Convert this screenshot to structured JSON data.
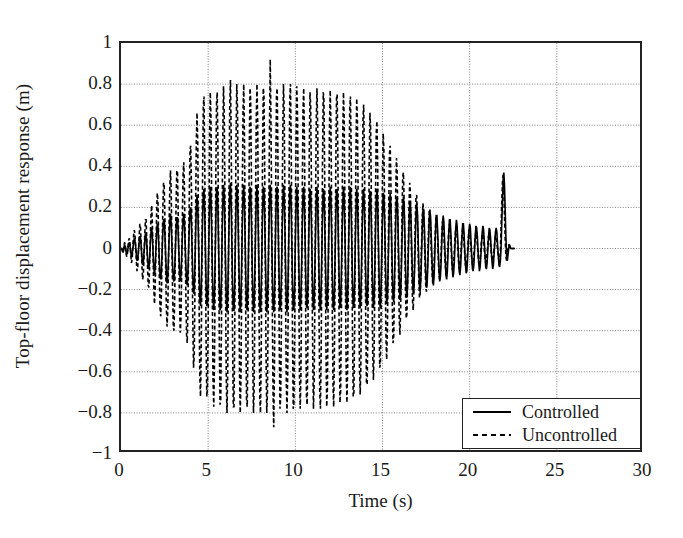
{
  "chart_data": {
    "type": "line",
    "title": "",
    "xlabel": "Time (s)",
    "ylabel": "Top-floor displacement response (m)",
    "xlim": [
      0,
      30
    ],
    "ylim": [
      -1,
      1
    ],
    "xticks": [
      0,
      5,
      10,
      15,
      20,
      25,
      30
    ],
    "yticks": [
      -1,
      -0.8,
      -0.6,
      -0.4,
      -0.2,
      0,
      0.2,
      0.4,
      0.6,
      0.8,
      1
    ],
    "xticklabels": [
      "0",
      "5",
      "10",
      "15",
      "20",
      "25",
      "30"
    ],
    "yticklabels": [
      "−1",
      "−0.8",
      "−0.6",
      "−0.4",
      "−0.2",
      "0",
      "0.2",
      "0.4",
      "0.6",
      "0.8",
      "1"
    ],
    "grid": true,
    "grid_style": "dotted",
    "grid_color": "#808080",
    "legend_position": "lower right",
    "legend_entries": [
      "Controlled",
      "Uncontrolled"
    ],
    "series": [
      {
        "name": "Controlled",
        "style": "solid",
        "color": "#000000",
        "linewidth": 1.6,
        "dt": 0.04,
        "x_start": 0,
        "values": [
          0.0,
          0.0,
          -0.01,
          -0.02,
          0.0,
          0.02,
          0.01,
          -0.01,
          -0.03,
          -0.02,
          0.0,
          0.02,
          0.03,
          0.01,
          -0.02,
          -0.04,
          -0.03,
          0.0,
          0.03,
          0.05,
          0.04,
          0.01,
          -0.03,
          -0.06,
          -0.05,
          -0.01,
          0.03,
          0.06,
          0.05,
          0.01,
          -0.04,
          -0.08,
          -0.07,
          -0.02,
          0.03,
          0.07,
          0.07,
          0.02,
          -0.04,
          -0.09,
          -0.1,
          -0.05,
          0.02,
          0.08,
          0.1,
          0.06,
          -0.02,
          -0.09,
          -0.13,
          -0.09,
          -0.01,
          0.07,
          0.12,
          0.11,
          0.03,
          -0.06,
          -0.13,
          -0.15,
          -0.1,
          -0.01,
          0.08,
          0.14,
          0.14,
          0.07,
          -0.03,
          -0.12,
          -0.17,
          -0.14,
          -0.05,
          0.05,
          0.13,
          0.17,
          0.12,
          0.02,
          -0.08,
          -0.15,
          -0.16,
          -0.1,
          0.0,
          0.09,
          0.15,
          0.15,
          0.08,
          -0.02,
          -0.11,
          -0.16,
          -0.13,
          -0.04,
          0.06,
          0.14,
          0.17,
          0.12,
          0.02,
          -0.08,
          -0.16,
          -0.18,
          -0.11,
          0.0,
          0.11,
          0.19,
          0.2,
          0.12,
          -0.01,
          -0.14,
          -0.22,
          -0.2,
          -0.08,
          0.07,
          0.2,
          0.26,
          0.21,
          0.07,
          -0.1,
          -0.24,
          -0.28,
          -0.2,
          -0.03,
          0.14,
          0.27,
          0.29,
          0.18,
          0.0,
          -0.17,
          -0.28,
          -0.27,
          -0.14,
          0.04,
          0.21,
          0.3,
          0.25,
          0.09,
          -0.1,
          -0.25,
          -0.3,
          -0.22,
          -0.05,
          0.14,
          0.28,
          0.3,
          0.19,
          0.0,
          -0.18,
          -0.3,
          -0.29,
          -0.15,
          0.05,
          0.22,
          0.31,
          0.26,
          0.1,
          -0.09,
          -0.25,
          -0.31,
          -0.24,
          -0.06,
          0.13,
          0.28,
          0.32,
          0.21,
          0.02,
          -0.17,
          -0.3,
          -0.3,
          -0.17,
          0.03,
          0.21,
          0.31,
          0.27,
          0.12,
          -0.07,
          -0.24,
          -0.31,
          -0.25,
          -0.08,
          0.11,
          0.26,
          0.31,
          0.22,
          0.04,
          -0.15,
          -0.29,
          -0.3,
          -0.19,
          0.01,
          0.19,
          0.3,
          0.28,
          0.14,
          -0.05,
          -0.22,
          -0.31,
          -0.26,
          -0.1,
          0.09,
          0.25,
          0.31,
          0.24,
          0.06,
          -0.13,
          -0.28,
          -0.31,
          -0.21,
          -0.02,
          0.17,
          0.3,
          0.29,
          0.16,
          -0.03,
          -0.2,
          -0.31,
          -0.27,
          -0.12,
          0.07,
          0.24,
          0.31,
          0.25,
          0.08,
          -0.11,
          -0.27,
          -0.31,
          -0.23,
          -0.05,
          0.15,
          0.29,
          0.3,
          0.18,
          -0.01,
          -0.19,
          -0.3,
          -0.28,
          -0.14,
          0.05,
          0.22,
          0.31,
          0.26,
          0.1,
          -0.09,
          -0.25,
          -0.31,
          -0.24,
          -0.07,
          0.13,
          0.28,
          0.31,
          0.21,
          0.02,
          -0.17,
          -0.3,
          -0.29,
          -0.17,
          0.03,
          0.2,
          0.3,
          0.26,
          0.11,
          -0.08,
          -0.24,
          -0.3,
          -0.24,
          -0.08,
          0.11,
          0.26,
          0.3,
          0.21,
          0.04,
          -0.15,
          -0.28,
          -0.29,
          -0.18,
          0.01,
          0.18,
          0.29,
          0.27,
          0.13,
          -0.05,
          -0.22,
          -0.3,
          -0.25,
          -0.1,
          0.08,
          0.24,
          0.3,
          0.23,
          0.06,
          -0.13,
          -0.27,
          -0.3,
          -0.2,
          -0.02,
          0.16,
          0.29,
          0.28,
          0.15,
          -0.03,
          -0.2,
          -0.3,
          -0.26,
          -0.11,
          0.07,
          0.23,
          0.3,
          0.24,
          0.08,
          -0.11,
          -0.26,
          -0.3,
          -0.22,
          -0.04,
          0.15,
          0.28,
          0.29,
          0.17,
          -0.01,
          -0.18,
          -0.29,
          -0.27,
          -0.13,
          0.05,
          0.21,
          0.3,
          0.25,
          0.09,
          -0.09,
          -0.24,
          -0.3,
          -0.23,
          -0.06,
          0.12,
          0.27,
          0.3,
          0.2,
          0.02,
          -0.16,
          -0.29,
          -0.28,
          -0.16,
          0.03,
          0.19,
          0.29,
          0.25,
          0.1,
          -0.08,
          -0.23,
          -0.29,
          -0.23,
          -0.07,
          0.11,
          0.25,
          0.29,
          0.2,
          0.03,
          -0.14,
          -0.27,
          -0.28,
          -0.17,
          0.01,
          0.17,
          0.28,
          0.26,
          0.12,
          -0.05,
          -0.21,
          -0.29,
          -0.24,
          -0.09,
          0.08,
          0.23,
          0.29,
          0.22,
          0.05,
          -0.12,
          -0.26,
          -0.29,
          -0.19,
          -0.02,
          0.15,
          0.27,
          0.26,
          0.14,
          -0.03,
          -0.18,
          -0.27,
          -0.24,
          -0.1,
          0.06,
          0.21,
          0.27,
          0.21,
          0.07,
          -0.1,
          -0.23,
          -0.26,
          -0.19,
          -0.03,
          0.13,
          0.24,
          0.25,
          0.15,
          -0.01,
          -0.15,
          -0.25,
          -0.23,
          -0.11,
          0.04,
          0.18,
          0.25,
          0.21,
          0.08,
          -0.08,
          -0.2,
          -0.24,
          -0.17,
          -0.03,
          0.11,
          0.22,
          0.22,
          0.13,
          -0.01,
          -0.14,
          -0.22,
          -0.2,
          -0.1,
          0.04,
          0.16,
          0.22,
          0.18,
          0.07,
          -0.07,
          -0.18,
          -0.21,
          -0.15,
          -0.03,
          0.1,
          0.19,
          0.19,
          0.11,
          -0.01,
          -0.12,
          -0.19,
          -0.17,
          -0.08,
          0.03,
          0.14,
          0.19,
          0.15,
          0.05,
          -0.06,
          -0.15,
          -0.18,
          -0.13,
          -0.03,
          0.08,
          0.16,
          0.16,
          0.09,
          -0.01,
          -0.1,
          -0.16,
          -0.14,
          -0.07,
          0.03,
          0.12,
          0.16,
          0.13,
          0.04,
          -0.05,
          -0.13,
          -0.15,
          -0.11,
          -0.02,
          0.07,
          0.14,
          0.14,
          0.08,
          -0.01,
          -0.09,
          -0.14,
          -0.12,
          -0.06,
          0.02,
          0.1,
          0.14,
          0.11,
          0.04,
          -0.04,
          -0.11,
          -0.13,
          -0.09,
          -0.02,
          0.06,
          0.12,
          0.12,
          0.07,
          -0.01,
          -0.08,
          -0.12,
          -0.11,
          -0.05,
          0.02,
          0.09,
          0.12,
          0.1,
          0.03,
          -0.04,
          -0.1,
          -0.11,
          -0.08,
          -0.01,
          0.06,
          0.11,
          0.1,
          0.06,
          -0.01,
          -0.07,
          -0.11,
          -0.09,
          -0.04,
          0.02,
          0.08,
          0.11,
          0.09,
          0.03,
          -0.03,
          -0.09,
          -0.1,
          -0.07,
          -0.01,
          0.05,
          0.1,
          0.09,
          0.05,
          -0.01,
          -0.06,
          -0.1,
          -0.08,
          -0.03,
          0.03,
          0.08,
          0.1,
          0.08,
          0.02,
          -0.03,
          -0.08,
          -0.09,
          -0.06,
          0.0,
          0.12,
          0.22,
          0.32,
          0.37,
          0.3,
          0.18,
          0.05,
          -0.04,
          -0.06,
          -0.03,
          0.0,
          0.02,
          0.01,
          0.0,
          0.0,
          0.0,
          0.0,
          0.0,
          0.0,
          0.0
        ]
      },
      {
        "name": "Uncontrolled",
        "style": "dashed",
        "color": "#000000",
        "linewidth": 1.6,
        "dt": 0.04,
        "x_start": 0,
        "values": [
          0.0,
          0.0,
          -0.01,
          -0.02,
          0.0,
          0.03,
          0.02,
          -0.01,
          -0.04,
          -0.03,
          0.01,
          0.04,
          0.05,
          0.02,
          -0.03,
          -0.07,
          -0.05,
          0.01,
          0.06,
          0.09,
          0.07,
          0.01,
          -0.06,
          -0.11,
          -0.09,
          -0.02,
          0.06,
          0.12,
          0.1,
          0.02,
          -0.08,
          -0.15,
          -0.13,
          -0.04,
          0.06,
          0.14,
          0.14,
          0.04,
          -0.08,
          -0.18,
          -0.19,
          -0.09,
          0.04,
          0.16,
          0.21,
          0.12,
          -0.04,
          -0.19,
          -0.27,
          -0.19,
          -0.02,
          0.16,
          0.27,
          0.23,
          0.05,
          -0.14,
          -0.29,
          -0.33,
          -0.21,
          -0.01,
          0.19,
          0.32,
          0.3,
          0.14,
          -0.08,
          -0.28,
          -0.38,
          -0.31,
          -0.1,
          0.13,
          0.3,
          0.38,
          0.27,
          0.03,
          -0.2,
          -0.38,
          -0.4,
          -0.24,
          0.0,
          0.22,
          0.38,
          0.37,
          0.18,
          -0.06,
          -0.28,
          -0.41,
          -0.34,
          -0.11,
          0.15,
          0.36,
          0.42,
          0.29,
          0.04,
          -0.22,
          -0.42,
          -0.46,
          -0.28,
          0.0,
          0.28,
          0.48,
          0.5,
          0.3,
          -0.03,
          -0.36,
          -0.58,
          -0.52,
          -0.21,
          0.18,
          0.52,
          0.66,
          0.52,
          0.17,
          -0.26,
          -0.62,
          -0.72,
          -0.5,
          -0.07,
          0.36,
          0.69,
          0.74,
          0.46,
          0.0,
          -0.44,
          -0.72,
          -0.68,
          -0.36,
          0.1,
          0.54,
          0.76,
          0.64,
          0.23,
          -0.26,
          -0.64,
          -0.77,
          -0.56,
          -0.13,
          0.36,
          0.71,
          0.76,
          0.48,
          0.0,
          -0.46,
          -0.76,
          -0.74,
          -0.38,
          0.13,
          0.56,
          0.79,
          0.66,
          0.26,
          -0.23,
          -0.64,
          -0.8,
          -0.61,
          -0.15,
          0.33,
          0.71,
          0.82,
          0.54,
          0.05,
          -0.44,
          -0.77,
          -0.77,
          -0.44,
          0.08,
          0.54,
          0.8,
          0.69,
          0.31,
          -0.18,
          -0.61,
          -0.8,
          -0.64,
          -0.2,
          0.28,
          0.67,
          0.8,
          0.56,
          0.1,
          -0.38,
          -0.74,
          -0.77,
          -0.49,
          0.03,
          0.49,
          0.78,
          0.72,
          0.36,
          -0.13,
          -0.57,
          -0.8,
          -0.67,
          -0.26,
          0.23,
          0.64,
          0.8,
          0.62,
          0.15,
          -0.33,
          -0.72,
          -0.8,
          -0.54,
          -0.05,
          0.44,
          0.78,
          0.75,
          0.41,
          -0.08,
          -0.52,
          -0.8,
          -0.7,
          -0.31,
          0.18,
          0.61,
          0.92,
          0.64,
          0.2,
          -0.28,
          -0.69,
          -0.87,
          -0.59,
          -0.13,
          0.38,
          0.75,
          0.78,
          0.46,
          -0.03,
          -0.49,
          -0.78,
          -0.72,
          -0.36,
          0.13,
          0.57,
          0.8,
          0.67,
          0.26,
          -0.23,
          -0.64,
          -0.8,
          -0.62,
          -0.18,
          0.33,
          0.72,
          0.8,
          0.54,
          0.05,
          -0.44,
          -0.78,
          -0.75,
          -0.43,
          0.08,
          0.52,
          0.79,
          0.68,
          0.29,
          -0.2,
          -0.62,
          -0.78,
          -0.62,
          -0.2,
          0.28,
          0.67,
          0.78,
          0.54,
          0.1,
          -0.38,
          -0.73,
          -0.76,
          -0.46,
          0.03,
          0.47,
          0.76,
          0.7,
          0.34,
          -0.13,
          -0.55,
          -0.78,
          -0.65,
          -0.26,
          0.22,
          0.62,
          0.78,
          0.6,
          0.15,
          -0.33,
          -0.7,
          -0.78,
          -0.52,
          -0.05,
          0.43,
          0.76,
          0.73,
          0.39,
          -0.08,
          -0.51,
          -0.77,
          -0.68,
          -0.29,
          0.18,
          0.6,
          0.77,
          0.62,
          0.2,
          -0.28,
          -0.66,
          -0.77,
          -0.52,
          -0.1,
          0.38,
          0.73,
          0.75,
          0.44,
          -0.03,
          -0.47,
          -0.75,
          -0.69,
          -0.34,
          0.13,
          0.55,
          0.76,
          0.64,
          0.25,
          -0.22,
          -0.61,
          -0.75,
          -0.58,
          -0.16,
          0.32,
          0.68,
          0.74,
          0.5,
          0.04,
          -0.42,
          -0.72,
          -0.7,
          -0.4,
          0.07,
          0.49,
          0.73,
          0.63,
          0.27,
          -0.19,
          -0.58,
          -0.71,
          -0.56,
          -0.18,
          0.28,
          0.63,
          0.7,
          0.48,
          0.07,
          -0.36,
          -0.66,
          -0.66,
          -0.4,
          0.02,
          0.43,
          0.66,
          0.58,
          0.26,
          -0.17,
          -0.52,
          -0.64,
          -0.5,
          -0.16,
          0.26,
          0.56,
          0.62,
          0.42,
          0.05,
          -0.32,
          -0.58,
          -0.56,
          -0.32,
          0.02,
          0.36,
          0.56,
          0.48,
          0.21,
          -0.15,
          -0.44,
          -0.54,
          -0.4,
          -0.12,
          0.22,
          0.46,
          0.5,
          0.33,
          0.03,
          -0.26,
          -0.46,
          -0.44,
          -0.24,
          0.02,
          0.28,
          0.44,
          0.37,
          0.15,
          -0.12,
          -0.34,
          -0.42,
          -0.3,
          -0.08,
          0.17,
          0.35,
          0.37,
          0.24,
          0.01,
          -0.2,
          -0.34,
          -0.32,
          -0.17,
          0.02,
          0.21,
          0.32,
          0.27,
          0.1,
          -0.09,
          -0.25,
          -0.3,
          -0.21,
          -0.05,
          0.13,
          0.25,
          0.26,
          0.16,
          0.0,
          -0.14,
          -0.24,
          -0.22,
          -0.11,
          0.02,
          0.15,
          0.22,
          0.18,
          0.07,
          -0.07,
          -0.18,
          -0.21,
          -0.14,
          -0.03,
          0.09,
          0.18,
          0.18,
          0.1,
          -0.01,
          -0.11,
          -0.17,
          -0.15,
          -0.07,
          0.02,
          0.11,
          0.16,
          0.13,
          0.05,
          -0.05,
          -0.13,
          -0.15,
          -0.1,
          -0.02,
          0.07,
          0.13,
          0.13,
          0.07,
          -0.01,
          -0.08,
          -0.13,
          -0.11,
          -0.05,
          0.02,
          0.09,
          0.12,
          0.09,
          0.03,
          -0.04,
          -0.1,
          -0.11,
          -0.08,
          -0.01,
          0.05,
          0.1,
          0.1,
          0.06,
          0.0,
          -0.06,
          -0.1,
          -0.09,
          -0.04,
          0.02,
          0.07,
          0.1,
          0.08,
          0.02,
          -0.03,
          -0.08,
          -0.09,
          -0.06,
          -0.01,
          0.05,
          0.09,
          0.08,
          0.04,
          -0.01,
          -0.05,
          -0.08,
          -0.07,
          -0.03,
          0.02,
          0.06,
          0.08,
          0.06,
          0.02,
          -0.03,
          -0.07,
          -0.07,
          -0.05,
          0.0,
          0.04,
          0.07,
          0.07,
          0.04,
          -0.01,
          -0.04,
          -0.07,
          -0.06,
          -0.02,
          0.02,
          0.06,
          0.07,
          0.05,
          0.01,
          -0.02,
          -0.06,
          -0.06,
          -0.04,
          0.0,
          0.03,
          0.06,
          0.06,
          0.03,
          -0.01,
          -0.04,
          -0.06,
          -0.05,
          -0.02,
          0.1,
          0.22,
          0.32,
          0.36,
          0.28,
          0.16,
          0.04,
          -0.04,
          -0.06,
          -0.03,
          0.0,
          0.02,
          0.01,
          0.0,
          0.0,
          0.0,
          0.0,
          0.0,
          0.0,
          0.0
        ]
      }
    ]
  }
}
